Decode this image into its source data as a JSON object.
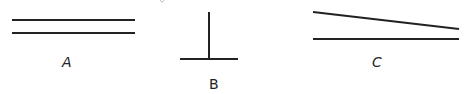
{
  "figures": [
    {
      "id": "A",
      "label": "A",
      "description": "two parallel horizontal lines",
      "lines": [
        {
          "x1": 12,
          "y1": 20,
          "x2": 135,
          "y2": 20
        },
        {
          "x1": 12,
          "y1": 33,
          "x2": 135,
          "y2": 33
        }
      ]
    },
    {
      "id": "B",
      "label": "B",
      "description": "perpendicular lines forming an inverted T",
      "lines": [
        {
          "x1": 209,
          "y1": 12,
          "x2": 209,
          "y2": 59
        },
        {
          "x1": 180,
          "y1": 59,
          "x2": 238,
          "y2": 59
        }
      ]
    },
    {
      "id": "C",
      "label": "C",
      "description": "two non-parallel lines converging to the right",
      "lines": [
        {
          "x1": 313,
          "y1": 12,
          "x2": 459,
          "y2": 29
        },
        {
          "x1": 313,
          "y1": 39,
          "x2": 459,
          "y2": 39
        }
      ]
    }
  ],
  "colors": {
    "line": "#222222",
    "background": "#ffffff"
  }
}
